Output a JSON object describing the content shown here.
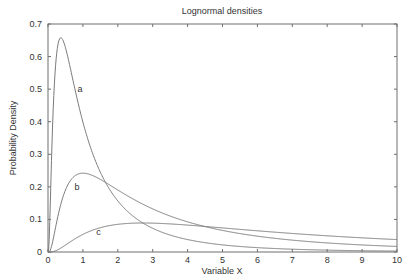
{
  "chart_data": {
    "type": "line",
    "title": "Lognormal densities",
    "xlabel": "Variable X",
    "ylabel": "Probability Density",
    "xlim": [
      0,
      10
    ],
    "ylim": [
      0,
      0.7
    ],
    "grid": false,
    "legend": "none (curves labeled inline)",
    "x_ticks": [
      "0",
      "1",
      "2",
      "3",
      "4",
      "5",
      "6",
      "7",
      "8",
      "9",
      "10"
    ],
    "y_ticks": [
      "0",
      "0.1",
      "0.2",
      "0.3",
      "0.4",
      "0.5",
      "0.6",
      "0.7"
    ],
    "x": [
      0.05,
      0.1,
      0.2,
      0.3,
      0.37,
      0.5,
      0.75,
      1,
      1.5,
      2,
      2.5,
      3,
      4,
      5,
      6,
      7,
      8,
      9,
      10
    ],
    "series": [
      {
        "name": "a",
        "label": "a",
        "mu": 0,
        "sigma": 1,
        "label_pos": [
          0.92,
          0.5
        ],
        "values": [
          0.0049,
          0.0281,
          0.4864,
          0.6279,
          0.6577,
          0.6276,
          0.5012,
          0.3989,
          0.2444,
          0.1569,
          0.1058,
          0.0727,
          0.0357,
          0.0183,
          0.0097,
          0.0053,
          0.003,
          0.0017,
          0.001
        ]
      },
      {
        "name": "b",
        "label": "b",
        "mu": 1,
        "sigma": 1,
        "label_pos": [
          0.83,
          0.2
        ],
        "values": [
          0.0,
          0.0017,
          0.0207,
          0.0566,
          0.0897,
          0.1487,
          0.2152,
          0.242,
          0.2358,
          0.2101,
          0.1812,
          0.1548,
          0.1131,
          0.0838,
          0.063,
          0.0481,
          0.0373,
          0.0293,
          0.0233
        ]
      },
      {
        "name": "c",
        "label": "c",
        "mu": 2,
        "sigma": 1,
        "label_pos": [
          1.45,
          0.062
        ],
        "values": [
          0.0,
          0.0,
          0.0013,
          0.0044,
          0.0078,
          0.014,
          0.03,
          0.054,
          0.072,
          0.082,
          0.0868,
          0.0885,
          0.0873,
          0.0829,
          0.0775,
          0.0721,
          0.0669,
          0.0621,
          0.0577
        ]
      }
    ]
  }
}
